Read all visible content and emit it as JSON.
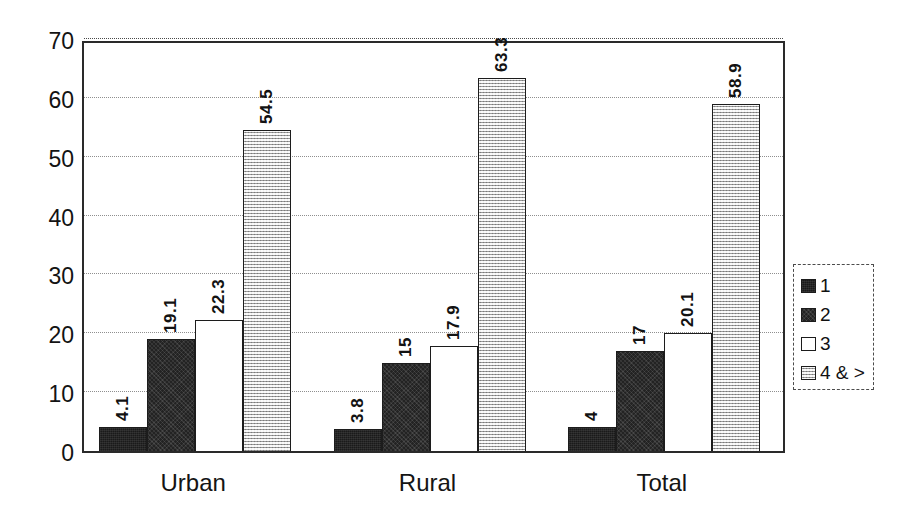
{
  "chart_data": {
    "type": "bar",
    "title": "",
    "subtitle": "",
    "xlabel": "",
    "ylabel": "",
    "categories": [
      "Urban",
      "Rural",
      "Total"
    ],
    "series": [
      {
        "name": "1",
        "values": [
          4.1,
          3.8,
          4
        ],
        "swatch": "#1a1a1a",
        "fill_class": "fill-s1"
      },
      {
        "name": "2",
        "values": [
          19.1,
          15,
          17
        ],
        "swatch": "#232323",
        "fill_class": "fill-s2"
      },
      {
        "name": "3",
        "values": [
          22.3,
          17.9,
          20.1
        ],
        "swatch": "#ffffff",
        "fill_class": "fill-s3"
      },
      {
        "name": "4 & >",
        "values": [
          54.5,
          63.3,
          58.9
        ],
        "swatch": "#c9c9c9",
        "fill_class": "fill-s4"
      }
    ],
    "value_labels": [
      [
        "4.1",
        "19.1",
        "22.3",
        "54.5"
      ],
      [
        "3.8",
        "15",
        "17.9",
        "63.3"
      ],
      [
        "4",
        "17",
        "20.1",
        "58.9"
      ]
    ],
    "ylim": [
      0,
      70
    ],
    "ytick_labels": [
      "0",
      "10",
      "20",
      "30",
      "40",
      "50",
      "60",
      "70"
    ],
    "ytick_values": [
      0,
      10,
      20,
      30,
      40,
      50,
      60,
      70
    ],
    "grid": true,
    "grid_style": "dotted-horizontal",
    "legend_position": "right",
    "legend_entries": [
      "1",
      "2",
      "3",
      "4 & >"
    ],
    "label_rotation": -90,
    "plot_border": true,
    "background_color": "#ffffff",
    "axis_color": "#2a2a2a",
    "gridline_color": "#8f8f8f"
  }
}
